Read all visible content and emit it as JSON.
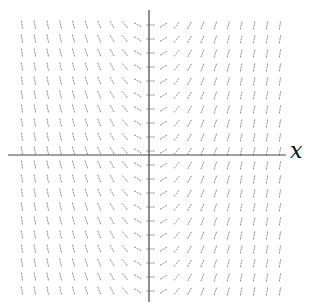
{
  "diagram": {
    "type": "slope_field",
    "axis_label_x": "x",
    "grid": {
      "columns": 21,
      "rows": 20,
      "x_start_px": 22,
      "x_step_px": 12.9,
      "y_start_px": 25,
      "y_step_px": 14,
      "center_col": 10
    },
    "axes": {
      "origin_px": [
        149,
        155
      ],
      "x_axis_extent_px": [
        8,
        286
      ],
      "y_axis_extent_px": [
        10,
        302
      ]
    },
    "segment_length_px": 9,
    "colors": {
      "axis": "#444444",
      "segment": "#888888",
      "label": "#111111"
    }
  }
}
